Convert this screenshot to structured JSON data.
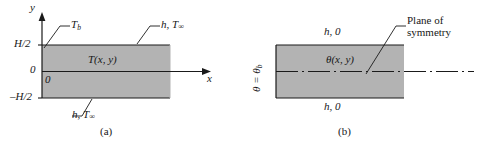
{
  "figure": {
    "panel_a": {
      "caption": "(a)",
      "axis_y_label": "y",
      "axis_x_label": "x",
      "y_ticks": [
        "H/2",
        "0",
        "–H/2"
      ],
      "origin_label": "0",
      "base_temp_label": "T",
      "base_temp_sub": "b",
      "convection_top": "h, T",
      "convection_top_sub": "∞",
      "convection_bottom": "h, T",
      "convection_bottom_sub": "∞",
      "field_label": "T(x, y)",
      "plate_fill": "#b3b3b3",
      "line_color": "#1a1a1a"
    },
    "panel_b": {
      "caption": "(b)",
      "base_label": "θ = θ",
      "base_label_sub": "b",
      "convection_top": "h, 0",
      "convection_bottom": "h, 0",
      "field_label": "θ(x, y)",
      "symmetry_label_line1": "Plane of",
      "symmetry_label_line2": "symmetry",
      "plate_fill": "#b3b3b3",
      "line_color": "#1a1a1a"
    }
  }
}
